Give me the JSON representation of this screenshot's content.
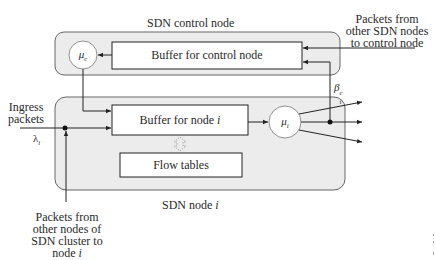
{
  "diagram": {
    "control_node": {
      "title": "SDN control node",
      "server_label_base": "μ",
      "server_label_sub": "c",
      "buffer_label": "Buffer for control node"
    },
    "sdn_node": {
      "title_base": "SDN node ",
      "title_var": "i",
      "buffer_label_base": "Buffer for node ",
      "buffer_label_var": "i",
      "server_label_base": "μ",
      "server_label_sub": "i",
      "flow_tables_label": "Flow tables"
    },
    "ingress": {
      "label_line1": "Ingress",
      "label_line2": "packets",
      "rate_base": "λ",
      "rate_sub": "i"
    },
    "feedback": {
      "prob_base": "β",
      "prob_sub": "i",
      "prob_sup": "c"
    },
    "external_inputs": {
      "to_control_line1": "Packets from",
      "to_control_line2": "other SDN nodes",
      "to_control_line3": "to control node",
      "to_node_line1": "Packets from",
      "to_node_line2": "other nodes of",
      "to_node_line3": "SDN cluster to",
      "to_node_line4_base": "node ",
      "to_node_line4_var": "i"
    },
    "colors": {
      "container_fill": "#ececec",
      "container_stroke": "#666666",
      "box_fill": "#ffffff",
      "line": "#222222"
    }
  }
}
